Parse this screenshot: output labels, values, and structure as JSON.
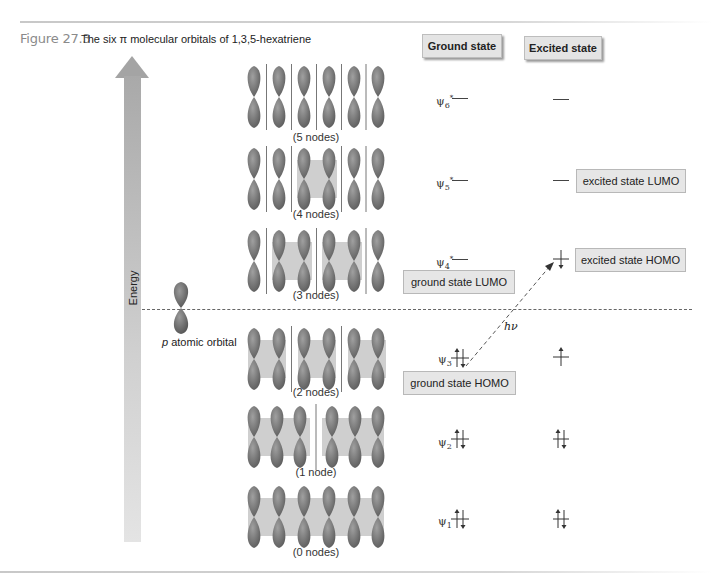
{
  "figure": {
    "number": "Figure 27.3",
    "caption": "The six π molecular orbitals of 1,3,5-hexatriene"
  },
  "headers": {
    "ground": "Ground state",
    "excited": "Excited state"
  },
  "axis": {
    "energy_label": "Energy"
  },
  "atomic_orbital_label": "atomic orbital",
  "atomic_orbital_p": "p",
  "photon_label": "hν",
  "orbitals": [
    {
      "psi": "ψ",
      "index": "6",
      "star": "*",
      "nodes_label": "(5 nodes)",
      "ground_electrons": "",
      "excited_electrons": ""
    },
    {
      "psi": "ψ",
      "index": "5",
      "star": "*",
      "nodes_label": "(4 nodes)",
      "ground_electrons": "",
      "excited_electrons": ""
    },
    {
      "psi": "ψ",
      "index": "4",
      "star": "*",
      "nodes_label": "(3 nodes)",
      "ground_electrons": "",
      "excited_electrons": "up"
    },
    {
      "psi": "ψ",
      "index": "3",
      "star": "",
      "nodes_label": "(2 nodes)",
      "ground_electrons": "up-down",
      "excited_electrons": "up"
    },
    {
      "psi": "ψ",
      "index": "2",
      "star": "",
      "nodes_label": "(1 node)",
      "ground_electrons": "up-down",
      "excited_electrons": "up-down"
    },
    {
      "psi": "ψ",
      "index": "1",
      "star": "",
      "nodes_label": "(0 nodes)",
      "ground_electrons": "up-down",
      "excited_electrons": "up-down"
    }
  ],
  "labels": {
    "excited_lumo": "excited state LUMO",
    "excited_homo": "excited state HOMO",
    "ground_lumo": "ground state LUMO",
    "ground_homo": "ground state HOMO"
  },
  "colors": {
    "lobe_dark": "#6f6f6f",
    "lobe_light": "#c9c9c9",
    "box_fill": "#e6e6e6",
    "arrow_gray": "#a9a9a9"
  }
}
